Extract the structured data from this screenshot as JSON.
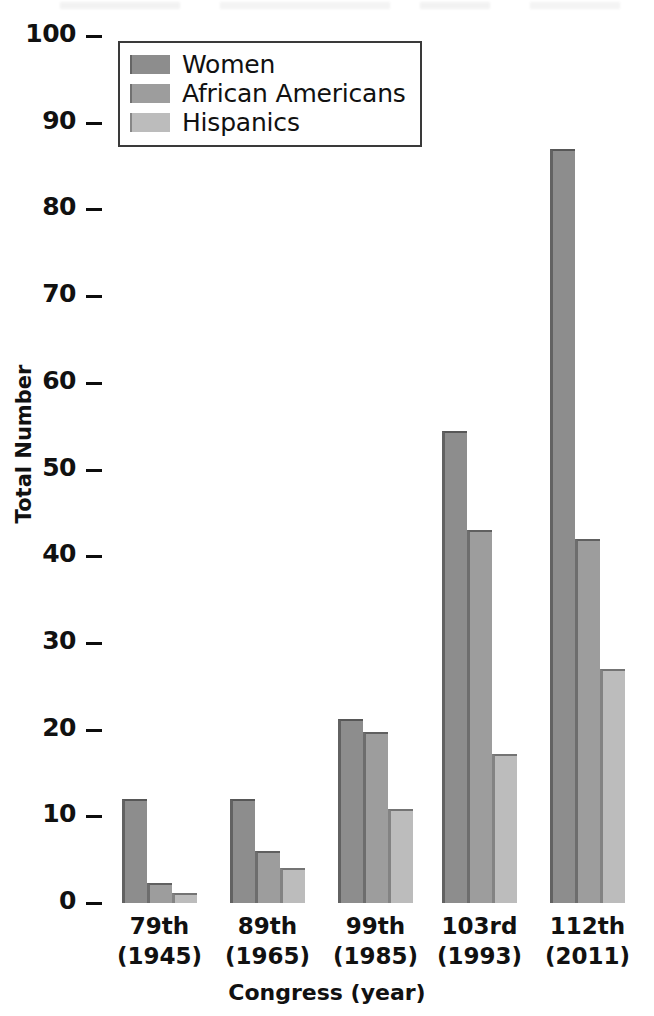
{
  "chart_data": {
    "type": "bar",
    "title": "",
    "xlabel": "Congress (year)",
    "ylabel": "Total Number",
    "ylim": [
      0,
      100
    ],
    "yticks": [
      0,
      10,
      20,
      30,
      40,
      50,
      60,
      70,
      80,
      90,
      100
    ],
    "grid": false,
    "legend_position": "top-left",
    "categories": [
      "79th\n(1945)",
      "89th\n(1965)",
      "99th\n(1985)",
      "103rd\n(1993)",
      "112th\n(2011)"
    ],
    "category_labels": [
      {
        "congress": "79th",
        "year": "(1945)"
      },
      {
        "congress": "89th",
        "year": "(1965)"
      },
      {
        "congress": "99th",
        "year": "(1985)"
      },
      {
        "congress": "103rd",
        "year": "(1993)"
      },
      {
        "congress": "112th",
        "year": "(2011)"
      }
    ],
    "series": [
      {
        "name": "Women",
        "color": "#8d8d8d",
        "values": [
          12,
          12,
          21.2,
          54.5,
          87
        ]
      },
      {
        "name": "African Americans",
        "color": "#9d9d9d",
        "values": [
          2.3,
          6,
          19.7,
          43,
          42
        ]
      },
      {
        "name": "Hispanics",
        "color": "#bcbcbc",
        "values": [
          1.2,
          4,
          10.9,
          17.2,
          27
        ]
      }
    ]
  },
  "axis": {
    "y_title": "Total Number",
    "x_title": "Congress (year)",
    "tick_labels": [
      "100",
      "90",
      "80",
      "70",
      "60",
      "50",
      "40",
      "30",
      "20",
      "10",
      "0"
    ]
  },
  "legend": {
    "items": [
      {
        "label": "Women",
        "color": "#8d8d8d"
      },
      {
        "label": "African Americans",
        "color": "#9d9d9d"
      },
      {
        "label": "Hispanics",
        "color": "#bcbcbc"
      }
    ]
  }
}
